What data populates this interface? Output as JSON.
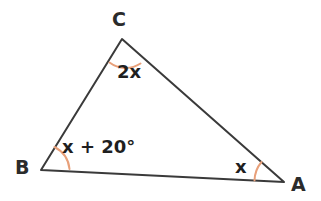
{
  "figure": {
    "type": "triangle-angle-diagram",
    "background_color": "#ffffff",
    "stroke_color": "#3a3a3a",
    "arc_color": "#e8a07a",
    "vertices": {
      "A": {
        "label": "A",
        "x": 284,
        "y": 182
      },
      "B": {
        "label": "B",
        "x": 41,
        "y": 170
      },
      "C": {
        "label": "C",
        "x": 122,
        "y": 39
      }
    },
    "angles": {
      "at_C": "2x",
      "at_B": "x + 20°",
      "at_A": "x"
    },
    "sides": [
      {
        "name": "BC",
        "from": "B",
        "to": "C"
      },
      {
        "name": "CA",
        "from": "C",
        "to": "A"
      },
      {
        "name": "AB",
        "from": "A",
        "to": "B"
      }
    ]
  }
}
